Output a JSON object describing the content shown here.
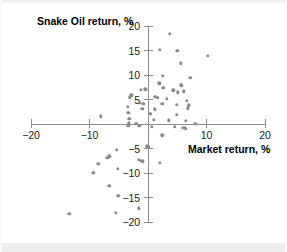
{
  "chart_data": {
    "type": "scatter",
    "title": "",
    "xlabel": "Market return, %",
    "ylabel": "Snake Oil return, %",
    "xlim": [
      -20,
      20
    ],
    "ylim": [
      -20,
      20
    ],
    "xticks": [
      -20,
      -10,
      10,
      20
    ],
    "yticks": [
      -20,
      -15,
      -10,
      -5,
      5,
      10,
      15,
      20
    ],
    "xtick_labels": [
      "−20",
      "−10",
      "10",
      "20"
    ],
    "ytick_labels": [
      "−20",
      "−15",
      "−10",
      "−5",
      "5",
      "10",
      "15",
      "20"
    ],
    "grid": false,
    "legend": null,
    "marker": "circle",
    "marker_color": "#8a8a8a",
    "axis_color": "#8c8c8c",
    "points": [
      [
        3.7,
        18.4
      ],
      [
        2.0,
        15.2
      ],
      [
        5.0,
        14.9
      ],
      [
        10.2,
        13.9
      ],
      [
        5.6,
        12.4
      ],
      [
        2.5,
        9.9
      ],
      [
        7.2,
        9.4
      ],
      [
        1.9,
        8.3
      ],
      [
        5.7,
        7.9
      ],
      [
        2.6,
        7.4
      ],
      [
        -0.5,
        7.1
      ],
      [
        -1.2,
        7.0
      ],
      [
        4.3,
        6.9
      ],
      [
        6.1,
        6.7
      ],
      [
        5.1,
        6.5
      ],
      [
        -2.9,
        5.9
      ],
      [
        -3.1,
        5.5
      ],
      [
        1.2,
        5.6
      ],
      [
        1.7,
        5.4
      ],
      [
        3.2,
        5.2
      ],
      [
        6.6,
        4.7
      ],
      [
        -1.4,
        4.4
      ],
      [
        -0.8,
        4.2
      ],
      [
        2.4,
        4.1
      ],
      [
        4.9,
        4.0
      ],
      [
        7.0,
        3.8
      ],
      [
        -3.5,
        3.5
      ],
      [
        -1.0,
        3.1
      ],
      [
        1.1,
        3.0
      ],
      [
        6.8,
        3.2
      ],
      [
        -3.4,
        2.3
      ],
      [
        0.4,
        2.1
      ],
      [
        4.9,
        1.9
      ],
      [
        -8.1,
        1.6
      ],
      [
        -3.2,
        1.1
      ],
      [
        1.0,
        0.9
      ],
      [
        3.5,
        0.8
      ],
      [
        6.4,
        0.7
      ],
      [
        -3.3,
        0.2
      ],
      [
        -2.0,
        0.1
      ],
      [
        8.1,
        0.0
      ],
      [
        -3.4,
        -0.3
      ],
      [
        -1.5,
        -0.4
      ],
      [
        0.6,
        -0.5
      ],
      [
        4.6,
        -0.6
      ],
      [
        5.9,
        -0.7
      ],
      [
        6.2,
        -0.8
      ],
      [
        6.4,
        -1.0
      ],
      [
        2.4,
        -2.3
      ],
      [
        -0.2,
        -4.5
      ],
      [
        0.1,
        -4.6
      ],
      [
        -5.3,
        -5.2
      ],
      [
        -6.6,
        -6.6
      ],
      [
        -7.0,
        -6.9
      ],
      [
        -1.6,
        -7.3
      ],
      [
        -1.2,
        -7.5
      ],
      [
        -0.9,
        -7.6
      ],
      [
        2.0,
        -7.9
      ],
      [
        -8.5,
        -8.1
      ],
      [
        -5.2,
        -9.1
      ],
      [
        -9.4,
        -10.0
      ],
      [
        -6.6,
        -12.6
      ],
      [
        -5.1,
        -14.6
      ],
      [
        -1.6,
        -17.2
      ],
      [
        -5.5,
        -18.1
      ],
      [
        -13.5,
        -18.3
      ]
    ]
  }
}
